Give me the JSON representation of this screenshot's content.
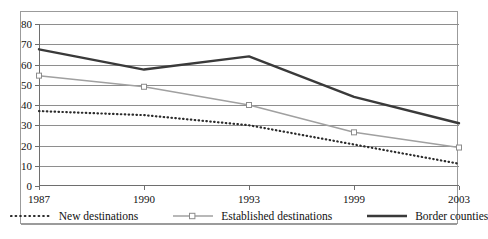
{
  "chart_data": {
    "type": "line",
    "title": "",
    "subtitle": "",
    "xlabel": "",
    "ylabel": "",
    "categories": [
      "1987",
      "1990",
      "1993",
      "1999",
      "2003"
    ],
    "x_tick_labels": [
      "1987",
      "1990",
      "1993",
      "1999",
      "2003"
    ],
    "y_tick_labels": [
      "0",
      "10",
      "20",
      "30",
      "40",
      "50",
      "60",
      "70",
      "80"
    ],
    "y_ticks": [
      0,
      10,
      20,
      30,
      40,
      50,
      60,
      70,
      80
    ],
    "ylim": [
      0,
      80
    ],
    "grid": "horizontal",
    "legend_position": "bottom",
    "series": [
      {
        "name": "New destinations",
        "style": "dotted",
        "color": "#2b2b2b",
        "marker": "none",
        "values": [
          37,
          35,
          30,
          20.5,
          11
        ]
      },
      {
        "name": "Established destinations",
        "style": "solid",
        "color": "#a0a0a0",
        "marker": "open-square",
        "values": [
          54.5,
          49,
          40,
          26.5,
          19
        ]
      },
      {
        "name": "Border counties",
        "style": "solid-thick",
        "color": "#3a3a3a",
        "marker": "none",
        "values": [
          67.5,
          57.5,
          64,
          44,
          31
        ]
      }
    ]
  },
  "legend": {
    "items": [
      {
        "label": "New destinations",
        "swatch": "dotted-line-swatch"
      },
      {
        "label": "Established destinations",
        "swatch": "gray-line-marker-swatch"
      },
      {
        "label": "Border counties",
        "swatch": "black-thick-line-swatch"
      }
    ]
  },
  "colors": {
    "new_destinations": "#2b2b2b",
    "established_destinations": "#a0a0a0",
    "border_counties": "#3a3a3a",
    "gridline": "#8e8e8e",
    "axis": "#6e6e6e",
    "frame": "#9b9b9b"
  }
}
